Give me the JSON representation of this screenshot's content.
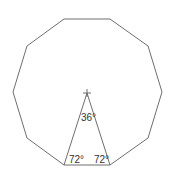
{
  "diagram": {
    "shape": "regular decagon",
    "sides": 10,
    "colors": {
      "line": "#6e6e6e",
      "text": "#333333",
      "background": "#ffffff"
    },
    "vertices": [
      [
        64,
        19
      ],
      [
        110,
        19
      ],
      [
        148,
        46
      ],
      [
        162,
        92
      ],
      [
        148,
        138
      ],
      [
        110,
        165
      ],
      [
        64,
        165
      ],
      [
        27,
        138
      ],
      [
        13,
        92
      ],
      [
        27,
        46
      ]
    ],
    "center": [
      87,
      93
    ],
    "triangle": {
      "apex": [
        87,
        93
      ],
      "base_left": [
        64,
        165
      ],
      "base_right": [
        110,
        165
      ]
    },
    "labels": {
      "apex_angle": "36°",
      "base_left_angle": "72°",
      "base_right_angle": "72°"
    }
  }
}
